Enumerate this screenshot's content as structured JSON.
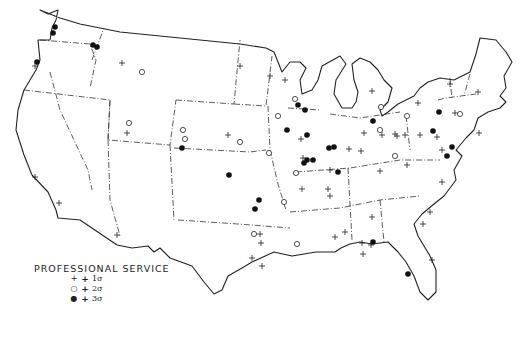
{
  "legend": {
    "title": "PROFESSIONAL SERVICE",
    "items": [
      {
        "symbol": "+",
        "plus": "+",
        "label": "1σ"
      },
      {
        "symbol": "○",
        "plus": "+",
        "label": "2σ"
      },
      {
        "symbol": "●",
        "plus": "+",
        "label": "3σ"
      }
    ]
  },
  "markers": {
    "plus_1sigma": [
      [
        122,
        63
      ],
      [
        35,
        66
      ],
      [
        240,
        66
      ],
      [
        270,
        76
      ],
      [
        285,
        80
      ],
      [
        127,
        133
      ],
      [
        228,
        135
      ],
      [
        372,
        91
      ],
      [
        450,
        84
      ],
      [
        478,
        92
      ],
      [
        418,
        103
      ],
      [
        455,
        113
      ],
      [
        382,
        135
      ],
      [
        395,
        134
      ],
      [
        405,
        135
      ],
      [
        420,
        135
      ],
      [
        437,
        137
      ],
      [
        442,
        150
      ],
      [
        397,
        136
      ],
      [
        349,
        149
      ],
      [
        364,
        133
      ],
      [
        361,
        151
      ],
      [
        330,
        170
      ],
      [
        301,
        139
      ],
      [
        303,
        158
      ],
      [
        35,
        177
      ],
      [
        59,
        203
      ],
      [
        117,
        235
      ],
      [
        330,
        196
      ],
      [
        380,
        171
      ],
      [
        407,
        165
      ],
      [
        479,
        133
      ],
      [
        260,
        234
      ],
      [
        261,
        243
      ],
      [
        252,
        258
      ],
      [
        262,
        266
      ],
      [
        372,
        217
      ],
      [
        345,
        232
      ],
      [
        335,
        237
      ],
      [
        430,
        212
      ],
      [
        442,
        182
      ],
      [
        423,
        224
      ],
      [
        432,
        260
      ],
      [
        362,
        243
      ],
      [
        371,
        245
      ],
      [
        363,
        254
      ],
      [
        328,
        189
      ],
      [
        302,
        189
      ]
    ],
    "circle_2sigma": [
      [
        142,
        72
      ],
      [
        295,
        99
      ],
      [
        129,
        123
      ],
      [
        183,
        130
      ],
      [
        185,
        139
      ],
      [
        240,
        142
      ],
      [
        278,
        116
      ],
      [
        460,
        114
      ],
      [
        380,
        130
      ],
      [
        407,
        116
      ],
      [
        381,
        107
      ],
      [
        284,
        202
      ],
      [
        297,
        244
      ],
      [
        254,
        234
      ],
      [
        296,
        173
      ],
      [
        269,
        153
      ],
      [
        395,
        156
      ]
    ],
    "dot_3sigma": [
      [
        55,
        27
      ],
      [
        53,
        33
      ],
      [
        93,
        45
      ],
      [
        97,
        47
      ],
      [
        37,
        62
      ],
      [
        298,
        105
      ],
      [
        305,
        110
      ],
      [
        287,
        130
      ],
      [
        307,
        135
      ],
      [
        329,
        148
      ],
      [
        334,
        147
      ],
      [
        313,
        160
      ],
      [
        338,
        172
      ],
      [
        229,
        175
      ],
      [
        182,
        148
      ],
      [
        259,
        200
      ],
      [
        255,
        209
      ],
      [
        307,
        160
      ],
      [
        304,
        163
      ],
      [
        373,
        121
      ],
      [
        439,
        112
      ],
      [
        433,
        131
      ],
      [
        452,
        147
      ],
      [
        447,
        156
      ],
      [
        408,
        274
      ],
      [
        373,
        242
      ]
    ]
  }
}
